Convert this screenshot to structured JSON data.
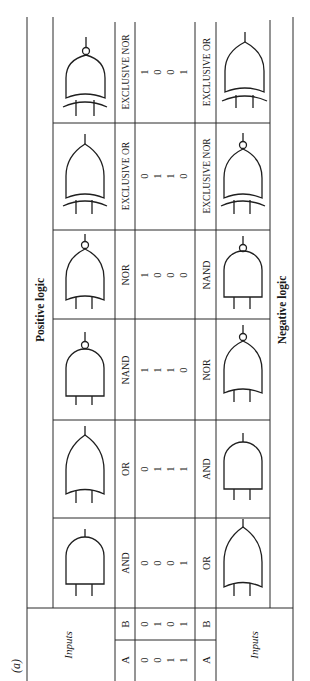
{
  "figure_label": "(a)",
  "positive_title": "Positive logic",
  "negative_title": "Negative logic",
  "inputs_label_top": "Inputs",
  "inputs_label_bottom": "Inputs",
  "input_headers": [
    "A",
    "B"
  ],
  "inputs": {
    "A": [
      "0",
      "0",
      "1",
      "1"
    ],
    "B": [
      "0",
      "1",
      "0",
      "1"
    ]
  },
  "columns": [
    {
      "positive": "AND",
      "negative": "OR",
      "outputs": [
        "0",
        "0",
        "0",
        "1"
      ]
    },
    {
      "positive": "OR",
      "negative": "AND",
      "outputs": [
        "0",
        "1",
        "1",
        "1"
      ]
    },
    {
      "positive": "NAND",
      "negative": "NOR",
      "outputs": [
        "1",
        "1",
        "1",
        "0"
      ]
    },
    {
      "positive": "NOR",
      "negative": "NAND",
      "outputs": [
        "1",
        "0",
        "0",
        "0"
      ]
    },
    {
      "positive": "EXCLUSIVE OR",
      "negative": "EXCLUSIVE NOR",
      "outputs": [
        "0",
        "1",
        "1",
        "0"
      ]
    },
    {
      "positive": "EXCLUSIVE NOR",
      "negative": "EXCLUSIVE OR",
      "outputs": [
        "1",
        "0",
        "0",
        "1"
      ]
    }
  ],
  "negative_row_headers": [
    "A",
    "B"
  ]
}
